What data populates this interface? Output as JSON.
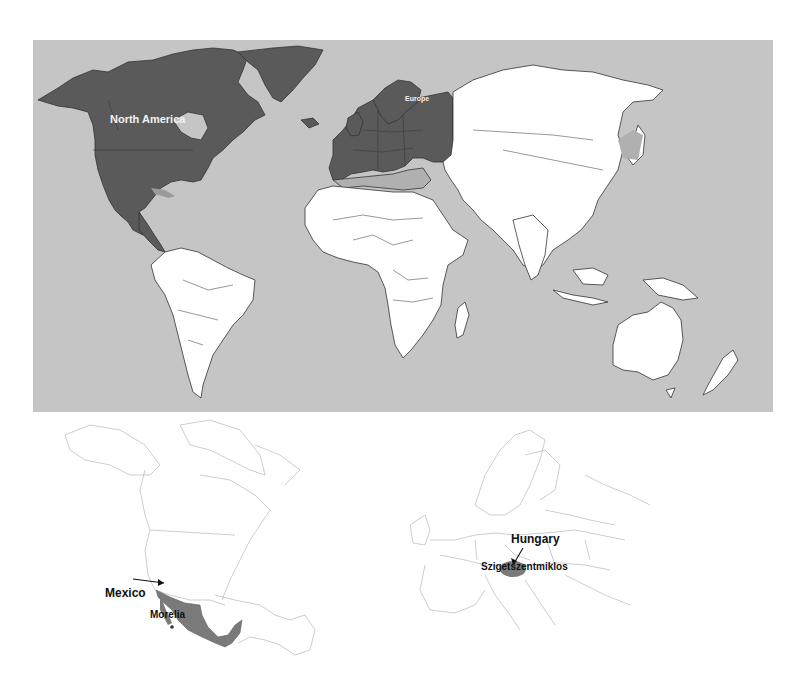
{
  "world_map": {
    "labels": {
      "north_america": "North America",
      "europe": "Europe"
    },
    "colors": {
      "ocean": "#c5c5c5",
      "highlighted_region": "#5a5a5a",
      "secondary_region": "#b0b0b0",
      "land": "#ffffff",
      "border": "#333333"
    }
  },
  "inset_north_america": {
    "country_label": "Mexico",
    "city_label": "Morelia",
    "highlight_color": "#7a7a7a"
  },
  "inset_europe": {
    "country_label": "Hungary",
    "city_label": "Szigetszentmiklos",
    "highlight_color": "#7a7a7a"
  }
}
